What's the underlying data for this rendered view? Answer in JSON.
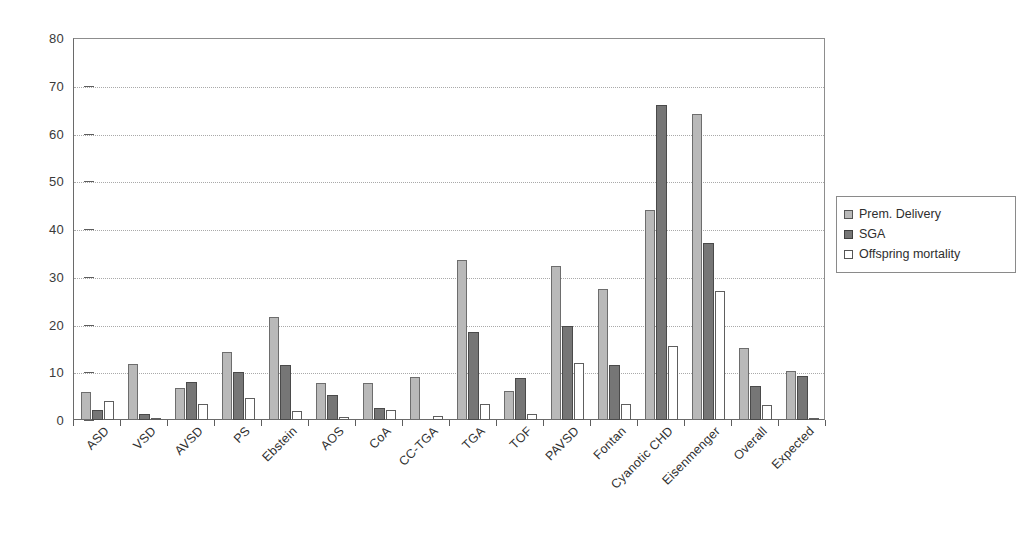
{
  "chart_data": {
    "type": "bar",
    "title": "",
    "subtitle": "",
    "xlabel": "",
    "ylabel": "",
    "ylim": [
      0,
      80
    ],
    "yticks": [
      0,
      10,
      20,
      30,
      40,
      50,
      60,
      70,
      80
    ],
    "grid": true,
    "grid_axis": "y",
    "legend_position": "right",
    "categories": [
      "ASD",
      "VSD",
      "AVSD",
      "PS",
      "Ebstein",
      "AOS",
      "CoA",
      "CC-TGA",
      "TGA",
      "TOF",
      "PAVSD",
      "Fontan",
      "Cyanotic CHD",
      "Eisenmenger",
      "Overall",
      "Expected"
    ],
    "series": [
      {
        "name": "Prem. Delivery",
        "color": "#b9b9b9",
        "values": [
          5.8,
          11.7,
          6.8,
          14.2,
          21.5,
          7.8,
          7.7,
          9.0,
          33.5,
          6.0,
          32.3,
          27.5,
          44.0,
          64.0,
          15.0,
          10.3
        ]
      },
      {
        "name": "SGA",
        "color": "#767676",
        "values": [
          2.0,
          1.2,
          7.9,
          10.0,
          11.5,
          5.3,
          2.5,
          0.0,
          18.5,
          8.7,
          19.6,
          11.5,
          66.0,
          37.0,
          7.2,
          9.2
        ]
      },
      {
        "name": "Offspring mortality",
        "color": "#ffffff",
        "values": [
          4.0,
          0.4,
          3.4,
          4.6,
          1.8,
          0.7,
          2.2,
          0.8,
          3.3,
          1.3,
          12.0,
          3.3,
          15.5,
          27.0,
          3.2,
          0.4
        ]
      }
    ]
  },
  "legend": {
    "items": [
      {
        "label": "Prem. Delivery"
      },
      {
        "label": "SGA"
      },
      {
        "label": "Offspring mortality"
      }
    ]
  }
}
